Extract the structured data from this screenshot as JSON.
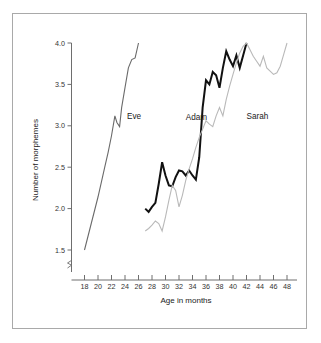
{
  "chart_data": {
    "type": "line",
    "title": "",
    "xlabel": "Age in months",
    "ylabel": "Number of morphemes",
    "xlim": [
      17,
      49
    ],
    "ylim": [
      1.3,
      4.05
    ],
    "grid": false,
    "legend_position": "inline-labels",
    "xticks": [
      18,
      20,
      22,
      24,
      26,
      28,
      30,
      32,
      34,
      36,
      38,
      40,
      42,
      44,
      46,
      48
    ],
    "xtick_labels": [
      "18",
      "20",
      "22",
      "24",
      "26",
      "28",
      "30",
      "32",
      "34",
      "36",
      "38",
      "40",
      "42",
      "44",
      "46",
      "48"
    ],
    "yticks": [
      1.5,
      2.0,
      2.5,
      3.0,
      3.5,
      4.0
    ],
    "ytick_labels": [
      "1.5",
      "2.0",
      "2.5",
      "3.0",
      "3.5",
      "4.0"
    ],
    "y_axis_break": true,
    "series": [
      {
        "name": "Eve",
        "color": "#6a6a6a",
        "width": 1.1,
        "label_x": 24.3,
        "label_y": 3.08,
        "x": [
          18.0,
          18.5,
          19.0,
          19.5,
          20.0,
          20.5,
          21.0,
          21.5,
          22.0,
          22.5,
          22.8,
          23.2,
          23.5,
          24.0,
          24.5,
          25.0,
          25.5,
          26.0
        ],
        "y": [
          1.5,
          1.66,
          1.82,
          1.98,
          2.14,
          2.32,
          2.5,
          2.68,
          2.88,
          3.12,
          3.04,
          2.99,
          3.22,
          3.46,
          3.7,
          3.8,
          3.82,
          4.0
        ]
      },
      {
        "name": "Adam",
        "color": "#111111",
        "width": 2.0,
        "label_x": 33.0,
        "label_y": 3.07,
        "x": [
          27.0,
          27.5,
          28.0,
          28.5,
          29.0,
          29.5,
          30.0,
          30.5,
          31.0,
          31.5,
          32.0,
          32.5,
          33.0,
          33.5,
          34.0,
          34.5,
          35.0,
          35.5,
          36.0,
          36.5,
          37.0,
          37.5,
          38.0,
          38.5,
          39.0,
          39.5,
          40.0,
          40.5,
          41.0,
          41.5,
          42.0
        ],
        "y": [
          2.0,
          1.96,
          2.02,
          2.07,
          2.3,
          2.56,
          2.4,
          2.28,
          2.27,
          2.38,
          2.46,
          2.45,
          2.4,
          2.46,
          2.4,
          2.35,
          2.62,
          3.22,
          3.55,
          3.5,
          3.65,
          3.61,
          3.46,
          3.7,
          3.9,
          3.8,
          3.72,
          3.85,
          3.7,
          3.85,
          4.0
        ]
      },
      {
        "name": "Sarah",
        "color": "#b9b9b9",
        "width": 1.1,
        "label_x": 42.0,
        "label_y": 3.08,
        "x": [
          27.0,
          27.5,
          28.0,
          28.5,
          29.0,
          29.5,
          30.0,
          30.5,
          31.0,
          31.5,
          32.0,
          32.5,
          33.0,
          33.5,
          34.0,
          34.5,
          35.0,
          35.5,
          36.0,
          36.5,
          37.0,
          37.5,
          38.0,
          38.5,
          39.0,
          39.5,
          40.0,
          40.5,
          41.0,
          41.5,
          42.0,
          42.5,
          43.0,
          43.5,
          44.0,
          44.5,
          45.0,
          45.5,
          46.0,
          46.5,
          47.0,
          47.5,
          48.0
        ],
        "y": [
          1.73,
          1.76,
          1.8,
          1.85,
          1.82,
          1.73,
          1.9,
          2.1,
          2.28,
          2.22,
          2.02,
          2.16,
          2.34,
          2.48,
          2.6,
          2.74,
          2.86,
          2.96,
          3.06,
          3.02,
          2.99,
          3.12,
          3.22,
          3.12,
          3.32,
          3.48,
          3.62,
          3.76,
          3.88,
          3.96,
          4.0,
          3.92,
          3.84,
          3.78,
          3.72,
          3.84,
          3.7,
          3.66,
          3.62,
          3.64,
          3.72,
          3.86,
          4.0
        ]
      }
    ]
  },
  "figure": {
    "xlabel": "Age in months",
    "ylabel": "Number of morphemes"
  }
}
